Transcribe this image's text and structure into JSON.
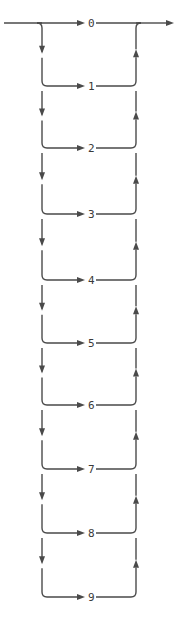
{
  "diagram": {
    "type": "syntax-railroad-diagram",
    "entry_label": "",
    "exit_label": "",
    "choices": [
      "0",
      "1",
      "2",
      "3",
      "4",
      "5",
      "6",
      "7",
      "8",
      "9"
    ],
    "row_y": [
      23,
      86,
      148,
      214,
      280,
      343,
      405,
      469,
      533,
      597
    ],
    "colors": {
      "line": "#4a4a4a",
      "text": "#3a3a3a",
      "background": "#ffffff"
    }
  }
}
